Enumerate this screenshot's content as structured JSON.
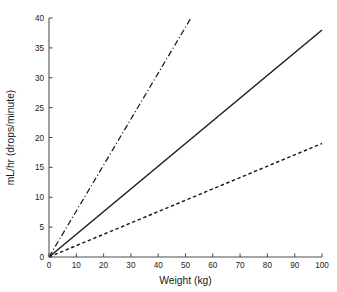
{
  "chart_data": {
    "type": "line",
    "title": "",
    "xlabel": "Weight (kg)",
    "ylabel": "mL/hr (drops/minute)",
    "xlim": [
      0,
      100
    ],
    "ylim": [
      0,
      40
    ],
    "xticks": [
      0,
      10,
      20,
      30,
      40,
      50,
      60,
      70,
      80,
      90,
      100
    ],
    "yticks": [
      0,
      5,
      10,
      15,
      20,
      25,
      30,
      35,
      40
    ],
    "xtick_labels": [
      "0",
      "10",
      "20",
      "30",
      "40",
      "50",
      "60",
      "70",
      "80",
      "90",
      "100"
    ],
    "ytick_labels": [
      "0",
      "5",
      "10",
      "15",
      "20",
      "25",
      "30",
      "35",
      "40"
    ],
    "grid": false,
    "legend": null,
    "legend_position": "none",
    "background_color": "#ffffff",
    "axis_color": "#4d4d4d",
    "line_color": "#1a1a1a",
    "series": [
      {
        "name": "steep",
        "style": "dash-dot",
        "slope": 0.769,
        "x": [
          0,
          52
        ],
        "values": [
          0,
          40
        ]
      },
      {
        "name": "middle",
        "style": "solid",
        "slope": 0.38,
        "x": [
          0,
          100
        ],
        "values": [
          0,
          38
        ]
      },
      {
        "name": "shallow",
        "style": "dashed",
        "slope": 0.19,
        "x": [
          0,
          100
        ],
        "values": [
          0,
          19
        ]
      }
    ]
  },
  "figure": {
    "width": 337,
    "height": 292,
    "plot_left": 49,
    "plot_right": 322,
    "plot_top": 18,
    "plot_bottom": 257
  }
}
